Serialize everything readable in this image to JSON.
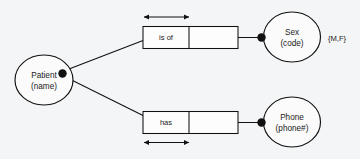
{
  "diagram": {
    "type": "orm-fact-type-diagram",
    "background_color": "#f4f5f6",
    "line_color": "#111111",
    "entities": [
      {
        "id": "patient",
        "name": "Patient",
        "reference_mode": "(name)"
      },
      {
        "id": "sex",
        "name": "Sex",
        "reference_mode": "(code)"
      },
      {
        "id": "phone",
        "name": "Phone",
        "reference_mode": "(phone#)"
      }
    ],
    "fact_types": [
      {
        "id": "patient-is-of-sex",
        "role_label": "is of",
        "second_role_label": "",
        "uniqueness": "first-role",
        "uniqueness_position": "above"
      },
      {
        "id": "patient-has-phone",
        "role_label": "has",
        "second_role_label": "",
        "uniqueness": "first-role",
        "uniqueness_position": "below"
      }
    ],
    "value_constraints": [
      {
        "id": "sex-values",
        "attached_to": "sex",
        "text": "{M,F}"
      }
    ]
  }
}
